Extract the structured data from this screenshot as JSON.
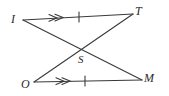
{
  "figure": {
    "background_color": "#ffffff",
    "stroke_color": "#3a3a3a",
    "stroke_width": 1,
    "vertices": [
      {
        "id": "I",
        "label": "I",
        "x": 23,
        "y": 20
      },
      {
        "id": "T",
        "label": "T",
        "x": 133,
        "y": 14
      },
      {
        "id": "O",
        "label": "O",
        "x": 34,
        "y": 82
      },
      {
        "id": "M",
        "label": "M",
        "x": 142,
        "y": 80
      },
      {
        "id": "S",
        "label": "S",
        "x": 80,
        "y": 50
      }
    ],
    "segments": [
      {
        "id": "IT",
        "from": "I",
        "to": "T",
        "x1": 23,
        "y1": 20,
        "x2": 133,
        "y2": 14,
        "marks": {
          "arrow_marks": 2,
          "tick_marks": 1
        }
      },
      {
        "id": "OM",
        "from": "O",
        "to": "M",
        "x1": 34,
        "y1": 82,
        "x2": 142,
        "y2": 80,
        "marks": {
          "arrow_marks": 2,
          "tick_marks": 1
        }
      },
      {
        "id": "IM",
        "from": "I",
        "to": "M",
        "x1": 23,
        "y1": 20,
        "x2": 142,
        "y2": 80,
        "marks": {
          "arrow_marks": 0,
          "tick_marks": 0
        }
      },
      {
        "id": "OT",
        "from": "O",
        "to": "T",
        "x1": 34,
        "y1": 82,
        "x2": 133,
        "y2": 14,
        "marks": {
          "arrow_marks": 0,
          "tick_marks": 0
        }
      }
    ],
    "intersection": {
      "id": "S",
      "label": "S",
      "x": 79,
      "y": 49
    },
    "marker_positions": {
      "top_arrow_x": 56,
      "top_arrow_y": 18,
      "top_tick_x": 79,
      "top_tick_y": 17,
      "bottom_arrow_x": 64,
      "bottom_arrow_y": 81,
      "bottom_tick_x": 85,
      "bottom_tick_y": 81
    }
  }
}
